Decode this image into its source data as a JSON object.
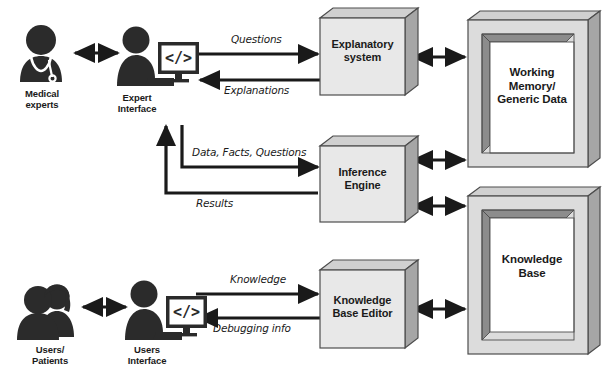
{
  "diagram": {
    "type": "block-diagram",
    "colors": {
      "ink": "#1a1a1a",
      "box_face": "#e8e8e8",
      "box_side": "#a6a6a6",
      "box_top": "#d0d0d0",
      "frame_face": "#dcdcdc",
      "frame_bevel": "#8c8c8c",
      "frame_inner": "#ffffff",
      "background": "#ffffff"
    }
  },
  "actors": [
    {
      "id": "medical-experts",
      "label": "Medical\nexperts",
      "icon": "doctor-icon"
    },
    {
      "id": "expert-interface",
      "label": "Expert\nInterface",
      "icon": "person-at-monitor-icon",
      "screen_glyph": "</>"
    },
    {
      "id": "users-patients",
      "label": "Users/\nPatients",
      "icon": "two-people-icon"
    },
    {
      "id": "users-interface",
      "label": "Users\nInterface",
      "icon": "person-at-monitor-icon",
      "screen_glyph": "</>"
    }
  ],
  "process_boxes": [
    {
      "id": "explanatory-system",
      "label": "Explanatory\nsystem"
    },
    {
      "id": "inference-engine",
      "label": "Inference\nEngine"
    },
    {
      "id": "knowledge-base-editor",
      "label": "Knowledge\nBase Editor"
    }
  ],
  "data_stores": [
    {
      "id": "working-memory",
      "label": "Working\nMemory/\nGeneric Data"
    },
    {
      "id": "knowledge-base",
      "label": "Knowledge\nBase"
    }
  ],
  "edge_labels": {
    "questions": "Questions",
    "explanations": "Explanations",
    "data_facts_questions": "Data, Facts, Questions",
    "results": "Results",
    "knowledge": "Knowledge",
    "debugging_info": "Debugging info"
  },
  "connectors": [
    {
      "id": "experts-to-expert-interface",
      "kind": "bidirectional"
    },
    {
      "id": "expert-interface-to-explanatory",
      "kind": "directed",
      "label": "Questions"
    },
    {
      "id": "explanatory-to-expert-interface",
      "kind": "directed",
      "label": "Explanations"
    },
    {
      "id": "expert-interface-to-inference",
      "kind": "directed-elbow",
      "label": "Data, Facts, Questions"
    },
    {
      "id": "inference-to-expert-interface",
      "kind": "directed-elbow",
      "label": "Results"
    },
    {
      "id": "explanatory-to-working-memory",
      "kind": "bidirectional"
    },
    {
      "id": "inference-to-working-memory",
      "kind": "bidirectional"
    },
    {
      "id": "inference-to-knowledge-base",
      "kind": "bidirectional"
    },
    {
      "id": "users-to-users-interface",
      "kind": "bidirectional"
    },
    {
      "id": "users-interface-to-kb-editor",
      "kind": "directed",
      "label": "Knowledge"
    },
    {
      "id": "kb-editor-to-users-interface",
      "kind": "directed",
      "label": "Debugging info"
    },
    {
      "id": "kb-editor-to-knowledge-base",
      "kind": "bidirectional"
    }
  ]
}
